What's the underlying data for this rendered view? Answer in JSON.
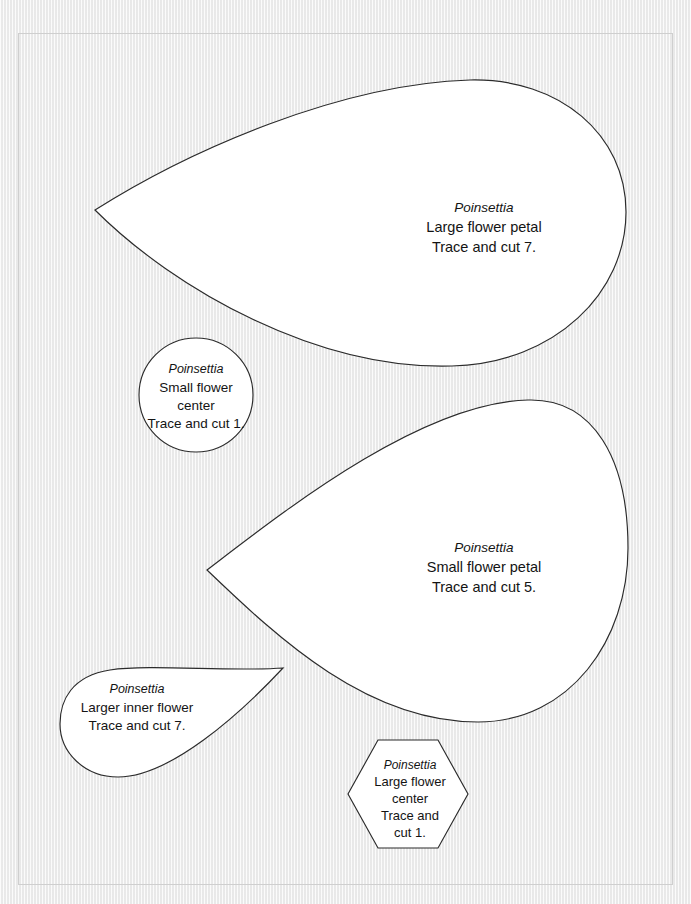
{
  "document": {
    "kind": "craft-template-sheet",
    "subject": "Poinsettia",
    "background_color": "#f1f1f1",
    "shape_fill_color": "#ffffff",
    "shape_outline_color": "#2b2b2b",
    "page_border_color": "#cfcfcf"
  },
  "shapes": [
    {
      "id": "large-flower-petal",
      "form": "teardrop-petal",
      "title": "Poinsettia",
      "lines": [
        "Large flower petal",
        "Trace and cut 7."
      ],
      "count": 7
    },
    {
      "id": "small-flower-center",
      "form": "circle",
      "title": "Poinsettia",
      "lines": [
        "Small flower",
        "center",
        "Trace and cut 1."
      ],
      "count": 1
    },
    {
      "id": "small-flower-petal",
      "form": "teardrop-petal",
      "title": "Poinsettia",
      "lines": [
        "Small flower petal",
        "Trace and cut 5."
      ],
      "count": 5
    },
    {
      "id": "larger-inner-flower",
      "form": "teardrop",
      "title": "Poinsettia",
      "lines": [
        "Larger inner flower",
        "Trace and cut 7."
      ],
      "count": 7
    },
    {
      "id": "large-flower-center",
      "form": "hexagon",
      "title": "Poinsettia",
      "lines": [
        "Large flower",
        "center",
        "Trace and",
        "cut 1."
      ],
      "count": 1
    }
  ]
}
